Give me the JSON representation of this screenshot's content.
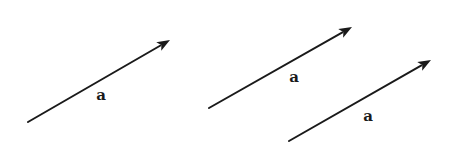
{
  "diagram": {
    "stroke_color": "#1a1a1a",
    "vectors": [
      {
        "label": "a",
        "start": [
          28,
          122
        ],
        "end": [
          170,
          40
        ],
        "label_pos": [
          101,
          95
        ]
      },
      {
        "label": "a",
        "start": [
          209,
          108
        ],
        "end": [
          352,
          27
        ],
        "label_pos": [
          294,
          77
        ]
      },
      {
        "label": "a",
        "start": [
          289,
          141
        ],
        "end": [
          431,
          60
        ],
        "label_pos": [
          368,
          116
        ]
      }
    ]
  }
}
